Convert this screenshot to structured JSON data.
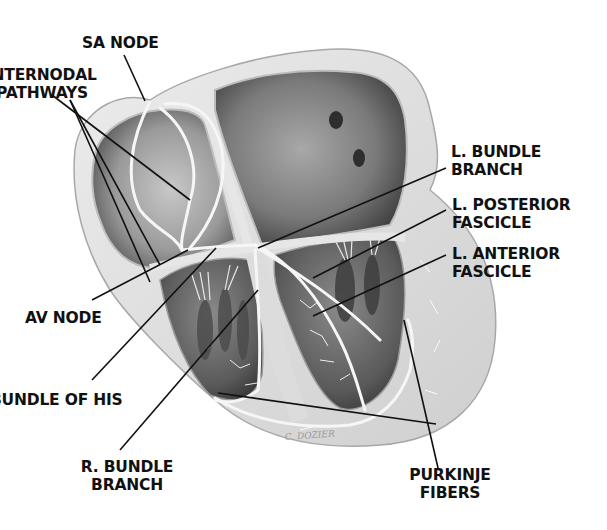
{
  "diagram": {
    "colors": {
      "background": "#ffffff",
      "text": "#111111",
      "leader_line": "#111111",
      "tissue_light": "#e4e4e4",
      "tissue_mid": "#bdbdbd",
      "chamber_dark": "#6a6a6a",
      "chamber_deep": "#3c3c3c",
      "conduction_fiber": "#f2f2f2"
    },
    "labels": {
      "sa_node": {
        "lines": [
          "SA NODE"
        ]
      },
      "internodal_pathways": {
        "lines": [
          "INTERNODAL",
          "PATHWAYS"
        ]
      },
      "l_bundle_branch": {
        "lines": [
          "L. BUNDLE",
          "BRANCH"
        ]
      },
      "l_posterior_fascicle": {
        "lines": [
          "L. POSTERIOR",
          "FASCICLE"
        ]
      },
      "l_anterior_fascicle": {
        "lines": [
          "L. ANTERIOR",
          "FASCICLE"
        ]
      },
      "av_node": {
        "lines": [
          "AV NODE"
        ]
      },
      "bundle_of_his": {
        "lines": [
          "BUNDLE OF HIS"
        ]
      },
      "r_bundle_branch": {
        "lines": [
          "R. BUNDLE",
          "BRANCH"
        ]
      },
      "purkinje_fibers": {
        "lines": [
          "PURKINJE",
          "FIBERS"
        ]
      }
    },
    "signature": "C. Dozier"
  }
}
